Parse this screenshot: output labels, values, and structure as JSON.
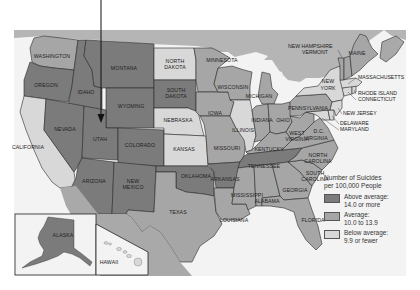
{
  "colors": {
    "above": "#7b7b7b",
    "average": "#a6a6a6",
    "below": "#d8d8d8",
    "canada": "#b5b5b5",
    "water": "#f3f3f3",
    "mexico": "#a9a9a9"
  },
  "legend": {
    "title_line1": "Number of Suicides",
    "title_line2": "per 100,000 People",
    "items": [
      {
        "line1": "Above average:",
        "line2": "14.0 or more",
        "color": "#7b7b7b"
      },
      {
        "line1": "Average:",
        "line2": "10.0 to 13.9",
        "color": "#a6a6a6"
      },
      {
        "line1": "Below average:",
        "line2": "9.9 or fewer",
        "color": "#d8d8d8"
      }
    ]
  },
  "states": {
    "washington": "WASHINGTON",
    "oregon": "OREGON",
    "california": "CALIFORNIA",
    "idaho": "IDAHO",
    "nevada": "NEVADA",
    "montana": "MONTANA",
    "wyoming": "WYOMING",
    "utah": "UTAH",
    "colorado": "COLORADO",
    "arizona": "ARIZONA",
    "new_mexico_1": "NEW",
    "new_mexico_2": "MEXICO",
    "north_dakota_1": "NORTH",
    "north_dakota_2": "DAKOTA",
    "south_dakota_1": "SOUTH",
    "south_dakota_2": "DAKOTA",
    "nebraska": "NEBRASKA",
    "kansas": "KANSAS",
    "oklahoma": "OKLAHOMA",
    "texas": "TEXAS",
    "minnesota": "MINNESOTA",
    "iowa": "IOWA",
    "missouri": "MISSOURI",
    "arkansas": "ARKANSAS",
    "louisiana": "LOUISIANA",
    "wisconsin": "WISCONSIN",
    "illinois": "ILLINOIS",
    "michigan": "MICHIGAN",
    "indiana": "INDIANA",
    "ohio": "OHIO",
    "kentucky": "KENTUCKY",
    "tennessee": "TENNESSEE",
    "mississippi": "MISSISSIPPI",
    "alabama": "ALABAMA",
    "georgia": "GEORGIA",
    "florida": "FLORIDA",
    "south_carolina_1": "SOUTH",
    "south_carolina_2": "CAROLINA",
    "north_carolina_1": "NORTH",
    "north_carolina_2": "CAROLINA",
    "virginia": "VIRGINIA",
    "west_virginia_1": "WEST",
    "west_virginia_2": "VIRGINIA",
    "dc": "D.C.",
    "pennsylvania": "PENNSYLVANIA",
    "new_york_1": "NEW",
    "new_york_2": "YORK",
    "new_jersey": "NEW JERSEY",
    "delaware": "DELAWARE",
    "maryland": "MARYLAND",
    "connecticut": "CONNECTICUT",
    "rhode_island": "RHODE ISLAND",
    "massachusetts": "MASSACHUSETTS",
    "new_hampshire": "NEW HAMPSHIRE",
    "vermont": "VERMONT",
    "maine": "MAINE",
    "alaska": "ALASKA",
    "hawaii": "HAWAII"
  }
}
